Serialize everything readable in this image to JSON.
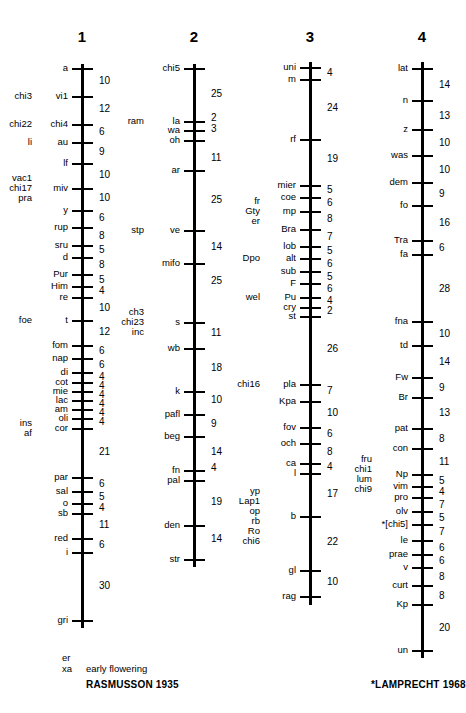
{
  "figure": {
    "type": "genetic-linkage-map",
    "organism_map_title": "",
    "chromosomes": [
      {
        "name": "1",
        "axis_x": 82,
        "top_y": 64,
        "bottom_y": 628,
        "loci": [
          {
            "label": "a",
            "y": 68,
            "left_extra": []
          },
          {
            "label": "vi1",
            "y": 96,
            "left_extra": [
              "chi3"
            ]
          },
          {
            "label": "chi4",
            "y": 124,
            "left_extra": [
              "chi22"
            ]
          },
          {
            "label": "au",
            "y": 142,
            "left_extra": [
              "li"
            ]
          },
          {
            "label": "lf",
            "y": 163,
            "left_extra": []
          },
          {
            "label": "miv",
            "y": 188,
            "left_extra": [
              "vac1",
              "chi17",
              "pra"
            ]
          },
          {
            "label": "y",
            "y": 210,
            "left_extra": []
          },
          {
            "label": "rup",
            "y": 227,
            "left_extra": []
          },
          {
            "label": "sru",
            "y": 245,
            "left_extra": []
          },
          {
            "label": "d",
            "y": 257,
            "left_extra": []
          },
          {
            "label": "Pur",
            "y": 274,
            "left_extra": []
          },
          {
            "label": "Him",
            "y": 286,
            "left_extra": []
          },
          {
            "label": "re",
            "y": 297,
            "left_extra": []
          },
          {
            "label": "t",
            "y": 320,
            "left_extra": [
              "foe"
            ]
          },
          {
            "label": "fom",
            "y": 345,
            "left_extra": []
          },
          {
            "label": "nap",
            "y": 358,
            "left_extra": []
          },
          {
            "label": "di",
            "y": 372,
            "left_extra": []
          },
          {
            "label": "cot",
            "y": 382,
            "left_extra": []
          },
          {
            "label": "mie",
            "y": 391,
            "left_extra": []
          },
          {
            "label": "lac",
            "y": 400,
            "left_extra": []
          },
          {
            "label": "am",
            "y": 409,
            "left_extra": []
          },
          {
            "label": "oli",
            "y": 418,
            "left_extra": []
          },
          {
            "label": "cor",
            "y": 428,
            "left_extra": [
              "ins",
              "af"
            ]
          },
          {
            "label": "par",
            "y": 477,
            "left_extra": []
          },
          {
            "label": "sal",
            "y": 491,
            "left_extra": []
          },
          {
            "label": "o",
            "y": 503,
            "left_extra": []
          },
          {
            "label": "sb",
            "y": 513,
            "left_extra": []
          },
          {
            "label": "red",
            "y": 538,
            "left_extra": []
          },
          {
            "label": "i",
            "y": 552,
            "left_extra": []
          },
          {
            "label": "gri",
            "y": 620,
            "left_extra": []
          }
        ],
        "distances": [
          {
            "value": "10",
            "y": 81
          },
          {
            "value": "12",
            "y": 109
          },
          {
            "value": "6",
            "y": 132
          },
          {
            "value": "9",
            "y": 152
          },
          {
            "value": "10",
            "y": 175
          },
          {
            "value": "10",
            "y": 198
          },
          {
            "value": "6",
            "y": 218
          },
          {
            "value": "8",
            "y": 236
          },
          {
            "value": "5",
            "y": 250
          },
          {
            "value": "8",
            "y": 265
          },
          {
            "value": "5",
            "y": 280
          },
          {
            "value": "4",
            "y": 291
          },
          {
            "value": "10",
            "y": 308
          },
          {
            "value": "12",
            "y": 332
          },
          {
            "value": "6",
            "y": 351
          },
          {
            "value": "6",
            "y": 365
          },
          {
            "value": "4",
            "y": 377
          },
          {
            "value": "4",
            "y": 386
          },
          {
            "value": "4",
            "y": 395
          },
          {
            "value": "4",
            "y": 404
          },
          {
            "value": "4",
            "y": 413
          },
          {
            "value": "4",
            "y": 422
          },
          {
            "value": "21",
            "y": 452
          },
          {
            "value": "6",
            "y": 484
          },
          {
            "value": "5",
            "y": 497
          },
          {
            "value": "4",
            "y": 508
          },
          {
            "value": "11",
            "y": 525
          },
          {
            "value": "6",
            "y": 545
          },
          {
            "value": "30",
            "y": 586
          }
        ]
      },
      {
        "name": "2",
        "axis_x": 194,
        "top_y": 64,
        "bottom_y": 567,
        "loci": [
          {
            "label": "chi5",
            "y": 68,
            "left_extra": []
          },
          {
            "label": "la",
            "y": 121,
            "left_extra": [
              "ram"
            ]
          },
          {
            "label": "wa",
            "y": 130,
            "left_extra": []
          },
          {
            "label": "oh",
            "y": 140,
            "left_extra": []
          },
          {
            "label": "ar",
            "y": 170,
            "left_extra": []
          },
          {
            "label": "ve",
            "y": 230,
            "left_extra": [
              "stp"
            ]
          },
          {
            "label": "mifo",
            "y": 263,
            "left_extra": []
          },
          {
            "label": "s",
            "y": 322,
            "left_extra": [
              "ch3",
              "chi23",
              "inc"
            ]
          },
          {
            "label": "wb",
            "y": 348,
            "left_extra": []
          },
          {
            "label": "k",
            "y": 391,
            "left_extra": []
          },
          {
            "label": "pafl",
            "y": 414,
            "left_extra": []
          },
          {
            "label": "beg",
            "y": 436,
            "left_extra": []
          },
          {
            "label": "fn",
            "y": 470,
            "left_extra": []
          },
          {
            "label": "pal",
            "y": 480,
            "left_extra": []
          },
          {
            "label": "den",
            "y": 525,
            "left_extra": []
          },
          {
            "label": "str",
            "y": 559,
            "left_extra": []
          }
        ],
        "distances": [
          {
            "value": "25",
            "y": 94
          },
          {
            "value": "2",
            "y": 118
          },
          {
            "value": "3",
            "y": 129
          },
          {
            "value": "11",
            "y": 158
          },
          {
            "value": "25",
            "y": 200
          },
          {
            "value": "14",
            "y": 247
          },
          {
            "value": "25",
            "y": 281
          },
          {
            "value": "11",
            "y": 333
          },
          {
            "value": "18",
            "y": 368
          },
          {
            "value": "10",
            "y": 400
          },
          {
            "value": "9",
            "y": 424
          },
          {
            "value": "14",
            "y": 452
          },
          {
            "value": "4",
            "y": 468
          },
          {
            "value": "19",
            "y": 502
          },
          {
            "value": "14",
            "y": 539
          }
        ]
      },
      {
        "name": "3",
        "axis_x": 310,
        "top_y": 62,
        "bottom_y": 605,
        "loci": [
          {
            "label": "uni",
            "y": 67,
            "left_extra": []
          },
          {
            "label": "m",
            "y": 79,
            "left_extra": []
          },
          {
            "label": "rf",
            "y": 139,
            "left_extra": []
          },
          {
            "label": "mier",
            "y": 185,
            "left_extra": []
          },
          {
            "label": "coe",
            "y": 197,
            "left_extra": []
          },
          {
            "label": "mp",
            "y": 211,
            "left_extra": [
              "fr",
              "Gty",
              "er"
            ]
          },
          {
            "label": "Bra",
            "y": 229,
            "left_extra": []
          },
          {
            "label": "lob",
            "y": 246,
            "left_extra": []
          },
          {
            "label": "alt",
            "y": 258,
            "left_extra": [
              "Dpo"
            ]
          },
          {
            "label": "sub",
            "y": 271,
            "left_extra": []
          },
          {
            "label": "F",
            "y": 283,
            "left_extra": []
          },
          {
            "label": "Pu",
            "y": 297,
            "left_extra": [
              "wel"
            ]
          },
          {
            "label": "cry",
            "y": 307,
            "left_extra": []
          },
          {
            "label": "st",
            "y": 316,
            "left_extra": []
          },
          {
            "label": "pla",
            "y": 384,
            "left_extra": [
              "chi16"
            ]
          },
          {
            "label": "Kpa",
            "y": 401,
            "left_extra": []
          },
          {
            "label": "fov",
            "y": 427,
            "left_extra": []
          },
          {
            "label": "och",
            "y": 443,
            "left_extra": []
          },
          {
            "label": "ca",
            "y": 463,
            "left_extra": []
          },
          {
            "label": "l",
            "y": 473,
            "left_extra": []
          },
          {
            "label": "b",
            "y": 516,
            "left_extra": [
              "yp",
              "Lap1",
              "op",
              "rb",
              "Ro",
              "chi6"
            ]
          },
          {
            "label": "gl",
            "y": 570,
            "left_extra": []
          },
          {
            "label": "rag",
            "y": 596,
            "left_extra": []
          }
        ],
        "distances": [
          {
            "value": "4",
            "y": 73
          },
          {
            "value": "24",
            "y": 108
          },
          {
            "value": "19",
            "y": 159
          },
          {
            "value": "5",
            "y": 190
          },
          {
            "value": "6",
            "y": 203
          },
          {
            "value": "8",
            "y": 219
          },
          {
            "value": "7",
            "y": 237
          },
          {
            "value": "5",
            "y": 251
          },
          {
            "value": "6",
            "y": 264
          },
          {
            "value": "5",
            "y": 277
          },
          {
            "value": "6",
            "y": 289
          },
          {
            "value": "4",
            "y": 301
          },
          {
            "value": "2",
            "y": 311
          },
          {
            "value": "26",
            "y": 349
          },
          {
            "value": "7",
            "y": 391
          },
          {
            "value": "10",
            "y": 413
          },
          {
            "value": "6",
            "y": 434
          },
          {
            "value": "8",
            "y": 452
          },
          {
            "value": "4",
            "y": 467
          },
          {
            "value": "17",
            "y": 494
          },
          {
            "value": "22",
            "y": 542
          },
          {
            "value": "10",
            "y": 582
          }
        ]
      },
      {
        "name": "4",
        "axis_x": 422,
        "top_y": 62,
        "bottom_y": 658,
        "loci": [
          {
            "label": "lat",
            "y": 68,
            "left_extra": []
          },
          {
            "label": "n",
            "y": 100,
            "left_extra": []
          },
          {
            "label": "z",
            "y": 129,
            "left_extra": []
          },
          {
            "label": "was",
            "y": 155,
            "left_extra": []
          },
          {
            "label": "dem",
            "y": 182,
            "left_extra": []
          },
          {
            "label": "fo",
            "y": 205,
            "left_extra": []
          },
          {
            "label": "Tra",
            "y": 240,
            "left_extra": []
          },
          {
            "label": "fa",
            "y": 254,
            "left_extra": []
          },
          {
            "label": "fna",
            "y": 321,
            "left_extra": []
          },
          {
            "label": "td",
            "y": 345,
            "left_extra": []
          },
          {
            "label": "Fw",
            "y": 377,
            "left_extra": []
          },
          {
            "label": "Br",
            "y": 397,
            "left_extra": []
          },
          {
            "label": "pat",
            "y": 428,
            "left_extra": []
          },
          {
            "label": "con",
            "y": 448,
            "left_extra": []
          },
          {
            "label": "Np",
            "y": 474,
            "left_extra": [
              "fru",
              "chi1",
              "lum",
              "chi9"
            ]
          },
          {
            "label": "vim",
            "y": 486,
            "left_extra": []
          },
          {
            "label": "pro",
            "y": 497,
            "left_extra": []
          },
          {
            "label": "olv",
            "y": 511,
            "left_extra": []
          },
          {
            "label": "*[chi5]",
            "y": 524,
            "left_extra": []
          },
          {
            "label": "le",
            "y": 540,
            "left_extra": []
          },
          {
            "label": "prae",
            "y": 554,
            "left_extra": []
          },
          {
            "label": "v",
            "y": 567,
            "left_extra": []
          },
          {
            "label": "curt",
            "y": 585,
            "left_extra": []
          },
          {
            "label": "Kp",
            "y": 604,
            "left_extra": []
          },
          {
            "label": "un",
            "y": 650,
            "left_extra": []
          }
        ],
        "distances": [
          {
            "value": "14",
            "y": 85
          },
          {
            "value": "13",
            "y": 116
          },
          {
            "value": "10",
            "y": 143
          },
          {
            "value": "10",
            "y": 170
          },
          {
            "value": "9",
            "y": 194
          },
          {
            "value": "16",
            "y": 223
          },
          {
            "value": "6",
            "y": 248
          },
          {
            "value": "28",
            "y": 289
          },
          {
            "value": "10",
            "y": 334
          },
          {
            "value": "14",
            "y": 362
          },
          {
            "value": "9",
            "y": 388
          },
          {
            "value": "13",
            "y": 413
          },
          {
            "value": "8",
            "y": 439
          },
          {
            "value": "11",
            "y": 462
          },
          {
            "value": "5",
            "y": 481
          },
          {
            "value": "4",
            "y": 492
          },
          {
            "value": "7",
            "y": 505
          },
          {
            "value": "5",
            "y": 518
          },
          {
            "value": "7",
            "y": 532
          },
          {
            "value": "6",
            "y": 548
          },
          {
            "value": "6",
            "y": 561
          },
          {
            "value": "8",
            "y": 577
          },
          {
            "value": "8",
            "y": 596
          },
          {
            "value": "20",
            "y": 628
          }
        ]
      }
    ],
    "captions": [
      {
        "id": "er-label",
        "text": "er",
        "x": 62,
        "y": 652,
        "style": "small-col"
      },
      {
        "id": "xa-label",
        "text": "xa",
        "x": 62,
        "y": 663,
        "style": "small-col"
      },
      {
        "id": "early-flowering",
        "text": "early flowering",
        "x": 86,
        "y": 663,
        "style": "small-col"
      },
      {
        "id": "rasmusson-ref",
        "text": "RASMUSSON 1935",
        "x": 86,
        "y": 679,
        "style": "bold"
      },
      {
        "id": "lamprecht-ref",
        "text": "*LAMPRECHT 1968",
        "x": 371,
        "y": 679,
        "style": "bold"
      }
    ]
  }
}
